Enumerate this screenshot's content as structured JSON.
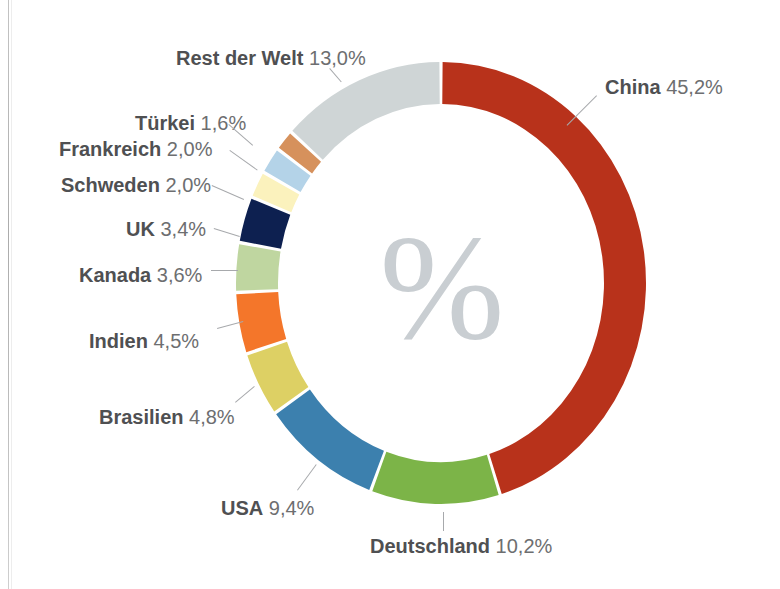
{
  "page": {
    "background_color": "#ffffff",
    "center_symbol": "%",
    "center_symbol_color": "#c9ced2"
  },
  "chart_data": {
    "type": "pie",
    "variant": "donut",
    "title": "",
    "subtitle": "",
    "xlabel": "",
    "ylabel": "",
    "unit": "%",
    "decimal_separator": ",",
    "legend_position": "callout-labels",
    "grid": false,
    "start_angle_deg": 0,
    "direction": "clockwise",
    "categories": [
      "China",
      "Deutschland",
      "USA",
      "Brasilien",
      "Indien",
      "Kanada",
      "UK",
      "Schweden",
      "Frankreich",
      "Türkei",
      "Rest der Welt"
    ],
    "values": [
      45.2,
      10.2,
      9.4,
      4.8,
      4.5,
      3.6,
      3.4,
      2.0,
      2.0,
      1.6,
      13.0
    ],
    "value_labels": [
      "45,2%",
      "10,2%",
      "9,4%",
      "4,8%",
      "4,5%",
      "3,6%",
      "3,4%",
      "2,0%",
      "2,0%",
      "1,6%",
      "13,0%"
    ],
    "colors": [
      "#b8321b",
      "#7cb448",
      "#3c80ae",
      "#ddd064",
      "#f4762a",
      "#bfd6a0",
      "#0d2050",
      "#fbf2bd",
      "#b4d3e8",
      "#d6915c",
      "#cfd5d6"
    ]
  },
  "slices": [
    {
      "name": "China",
      "percent_label": "45,2%",
      "value": 45.2,
      "color": "#b8321b",
      "label_side": "right",
      "label_x": 605,
      "label_y": 77,
      "leader": {
        "x1": 597,
        "y1": 96,
        "x2": 567,
        "y2": 126
      }
    },
    {
      "name": "Deutschland",
      "percent_label": "10,2%",
      "value": 10.2,
      "color": "#7cb448",
      "label_side": "center",
      "label_x": 370,
      "label_y": 536,
      "leader": {
        "x1": 444,
        "y1": 512,
        "x2": 444,
        "y2": 531
      }
    },
    {
      "name": "USA",
      "percent_label": "9,4%",
      "value": 9.4,
      "color": "#3c80ae",
      "label_side": "left-bottom",
      "label_x": 221,
      "label_y": 498,
      "leader": {
        "x1": 297,
        "y1": 490,
        "x2": 316,
        "y2": 464
      }
    },
    {
      "name": "Brasilien",
      "percent_label": "4,8%",
      "value": 4.8,
      "color": "#ddd064",
      "label_side": "left",
      "label_x": 99,
      "label_y": 407,
      "leader": {
        "x1": 235,
        "y1": 402,
        "x2": 254,
        "y2": 386
      }
    },
    {
      "name": "Indien",
      "percent_label": "4,5%",
      "value": 4.5,
      "color": "#f4762a",
      "label_side": "left",
      "label_x": 89,
      "label_y": 331,
      "leader": {
        "x1": 217,
        "y1": 328,
        "x2": 243,
        "y2": 321
      }
    },
    {
      "name": "Kanada",
      "percent_label": "3,6%",
      "value": 3.6,
      "color": "#bfd6a0",
      "label_side": "left",
      "label_x": 79,
      "label_y": 265,
      "leader": {
        "x1": 211,
        "y1": 270,
        "x2": 238,
        "y2": 270
      }
    },
    {
      "name": "UK",
      "percent_label": "3,4%",
      "value": 3.4,
      "color": "#0d2050",
      "label_side": "left",
      "label_x": 126,
      "label_y": 219,
      "leader": {
        "x1": 214,
        "y1": 228,
        "x2": 240,
        "y2": 236
      }
    },
    {
      "name": "Schweden",
      "percent_label": "2,0%",
      "value": 2.0,
      "color": "#fbf2bd",
      "label_side": "left",
      "label_x": 61,
      "label_y": 175,
      "leader": {
        "x1": 212,
        "y1": 185,
        "x2": 244,
        "y2": 199
      }
    },
    {
      "name": "Frankreich",
      "percent_label": "2,0%",
      "value": 2.0,
      "color": "#b4d3e8",
      "label_side": "left",
      "label_x": 59,
      "label_y": 139,
      "leader": {
        "x1": 230,
        "y1": 150,
        "x2": 258,
        "y2": 170
      }
    },
    {
      "name": "Türkei",
      "percent_label": "1,6%",
      "value": 1.6,
      "color": "#d6915c",
      "label_side": "left",
      "label_x": 135,
      "label_y": 113,
      "leader": {
        "x1": 229,
        "y1": 124,
        "x2": 253,
        "y2": 145
      }
    },
    {
      "name": "Rest der Welt",
      "percent_label": "13,0%",
      "value": 13.0,
      "color": "#cfd5d6",
      "label_side": "top",
      "label_x": 176,
      "label_y": 48,
      "leader": {
        "x1": 330,
        "y1": 68,
        "x2": 342,
        "y2": 82
      }
    }
  ]
}
